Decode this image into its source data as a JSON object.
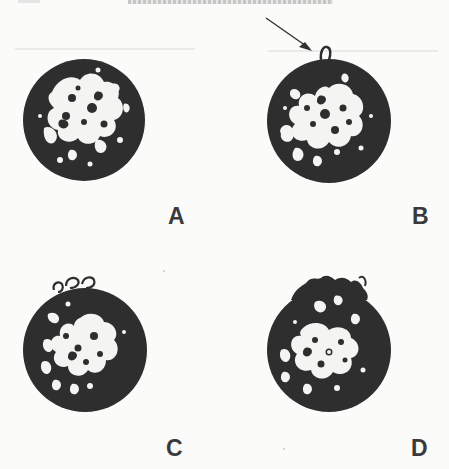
{
  "figure": {
    "running_head": "",
    "panels": [
      {
        "id": "A",
        "label": "A",
        "has_arrow": false,
        "surface_feature": "smooth rim"
      },
      {
        "id": "B",
        "label": "B",
        "has_arrow": true,
        "surface_feature": "single loop protrusion at top, indicated by arrow"
      },
      {
        "id": "C",
        "label": "C",
        "has_arrow": false,
        "surface_feature": "several small loops at top"
      },
      {
        "id": "D",
        "label": "D",
        "has_arrow": false,
        "surface_feature": "irregular ruffled top edge"
      }
    ],
    "colors": {
      "background": "#fbfbfa",
      "cell_dark": "#2e2e2e",
      "cell_light": "#f4f4f2",
      "label": "#3a3a3a"
    }
  }
}
